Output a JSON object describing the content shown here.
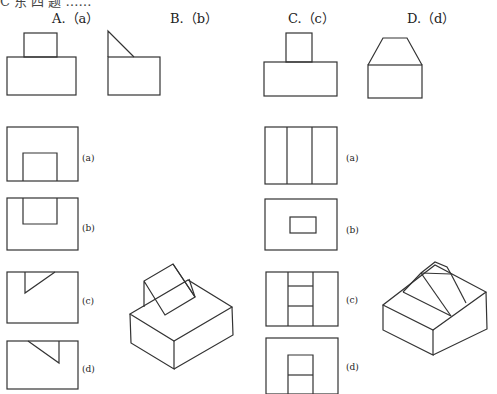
{
  "question": {
    "truncated_header": "C 东 四 题 ……"
  },
  "choices": [
    {
      "id": "A",
      "label": "A.（a）"
    },
    {
      "id": "B",
      "label": "B.（b）"
    },
    {
      "id": "C",
      "label": "C.（c）"
    },
    {
      "id": "D",
      "label": "D.（d）"
    }
  ],
  "left_group": {
    "options": [
      "(a)",
      "(b)",
      "(c)",
      "(d)"
    ]
  },
  "right_group": {
    "options": [
      "(a)",
      "(b)",
      "(c)",
      "(d)"
    ]
  },
  "figures": {
    "left_isometric": "isometric-block-with-triangular-prism",
    "right_isometric": "isometric-block-with-trapezoidal-ridge"
  }
}
